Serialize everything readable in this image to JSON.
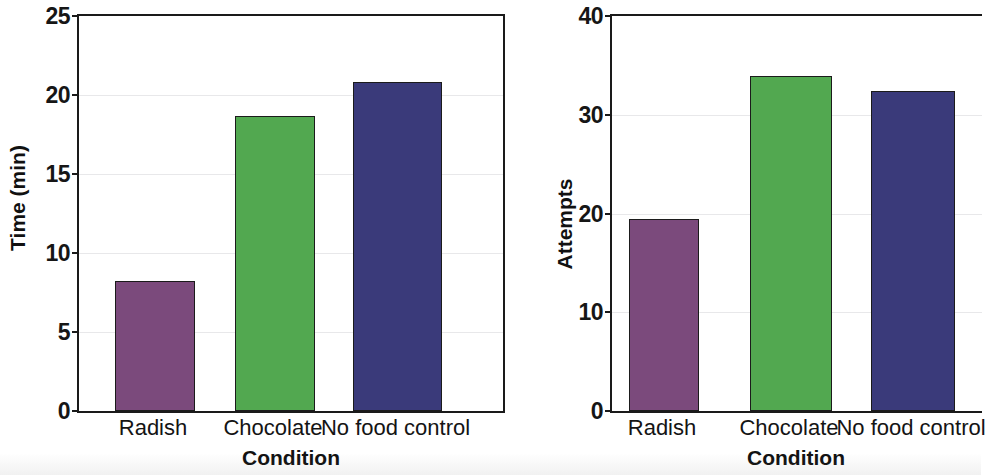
{
  "figure": {
    "background": "#ffffff",
    "panels": [
      "left",
      "right"
    ]
  },
  "colors": {
    "radish": "#7B4A7C",
    "chocolate": "#52A850",
    "no_food_control": "#3A3A7A",
    "axis": "#1a1a1a",
    "gridline": "#e8e8ea",
    "text": "#111111"
  },
  "left_panel": {
    "ylabel": "Time (min)",
    "xlabel": "Condition",
    "yticks": [
      "0",
      "5",
      "10",
      "15",
      "20",
      "25"
    ],
    "categories": [
      "Radish",
      "Chocolate",
      "No food control"
    ]
  },
  "right_panel": {
    "ylabel": "Attempts",
    "xlabel": "Condition",
    "yticks": [
      "0",
      "10",
      "20",
      "30",
      "40"
    ],
    "categories": [
      "Radish",
      "Chocolate",
      "No food control"
    ]
  },
  "chart_data": [
    {
      "type": "bar",
      "panel": "left",
      "title": "",
      "xlabel": "Condition",
      "ylabel": "Time (min)",
      "categories": [
        "Radish",
        "Chocolate",
        "No food control"
      ],
      "values": [
        8.2,
        18.7,
        20.8
      ],
      "colors": [
        "#7B4A7C",
        "#52A850",
        "#3A3A7A"
      ],
      "ylim": [
        0,
        25
      ],
      "yticks": [
        0,
        5,
        10,
        15,
        20,
        25
      ],
      "grid": true,
      "legend": "none"
    },
    {
      "type": "bar",
      "panel": "right",
      "title": "",
      "xlabel": "Condition",
      "ylabel": "Attempts",
      "categories": [
        "Radish",
        "Chocolate",
        "No food control"
      ],
      "values": [
        19.4,
        33.9,
        32.4
      ],
      "colors": [
        "#7B4A7C",
        "#52A850",
        "#3A3A7A"
      ],
      "ylim": [
        0,
        40
      ],
      "yticks": [
        0,
        10,
        20,
        30,
        40
      ],
      "grid": true,
      "legend": "none"
    }
  ]
}
